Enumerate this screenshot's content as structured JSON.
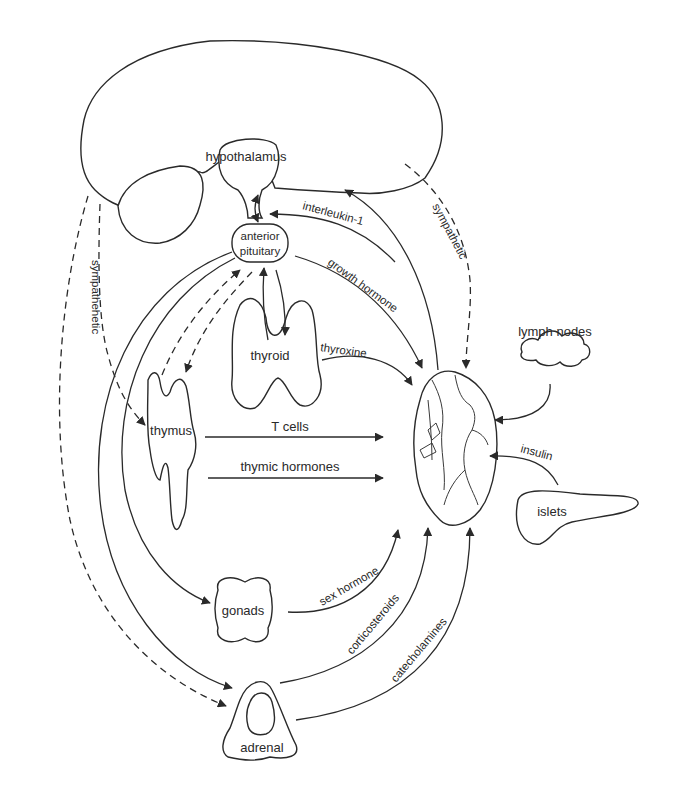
{
  "diagram": {
    "colors": {
      "stroke": "#2a2a2a",
      "background": "#ffffff"
    },
    "organs": {
      "brain": "brain",
      "hypothalamus": "hypothalamus",
      "anterior_pituitary_line1": "anterior",
      "anterior_pituitary_line2": "pituitary",
      "thyroid": "thyroid",
      "thymus": "thymus",
      "gonads": "gonads",
      "adrenal": "adrenal",
      "lymph_nodes": "lymph nodes",
      "islets": "islets",
      "spleen": "spleen"
    },
    "signals": {
      "interleukin_1": "interleukin-1",
      "growth_hormone": "growth hormone",
      "thyroxine": "thyroxine",
      "t_cells": "T cells",
      "thymic_hormones": "thymic hormones",
      "sex_hormone": "sex hormone",
      "corticosteroids": "corticosteroids",
      "catecholamines": "catecholamines",
      "insulin": "insulin",
      "sympathetic_right": "sympathetic",
      "sympathetic_left": "sympathehetic"
    },
    "edges": [
      {
        "from": "hypothalamus",
        "to": "anterior pituitary",
        "type": "bidirectional",
        "style": "solid"
      },
      {
        "from": "spleen",
        "to": "anterior pituitary",
        "label": "interleukin-1",
        "style": "solid"
      },
      {
        "from": "spleen",
        "to": "brain",
        "style": "solid"
      },
      {
        "from": "anterior pituitary",
        "to": "spleen",
        "label": "growth hormone",
        "style": "solid"
      },
      {
        "from": "brain",
        "to": "spleen",
        "label": "sympathetic",
        "style": "dashed"
      },
      {
        "from": "anterior pituitary",
        "to": "thyroid",
        "type": "bidirectional",
        "style": "solid"
      },
      {
        "from": "thyroid",
        "to": "spleen",
        "label": "thyroxine",
        "style": "solid"
      },
      {
        "from": "thymus",
        "to": "anterior pituitary",
        "type": "bidirectional",
        "style": "dashed"
      },
      {
        "from": "thymus",
        "to": "spleen",
        "label": "T cells",
        "style": "solid"
      },
      {
        "from": "thymus",
        "to": "spleen",
        "label": "thymic hormones",
        "style": "solid"
      },
      {
        "from": "brain",
        "to": "thymus",
        "label": "sympathehetic",
        "style": "dashed"
      },
      {
        "from": "brain",
        "to": "adrenal",
        "style": "dashed"
      },
      {
        "from": "anterior pituitary",
        "to": "gonads",
        "style": "solid"
      },
      {
        "from": "anterior pituitary",
        "to": "adrenal",
        "style": "solid"
      },
      {
        "from": "gonads",
        "to": "spleen",
        "label": "sex hormone",
        "style": "solid"
      },
      {
        "from": "adrenal",
        "to": "spleen",
        "label": "corticosteroids",
        "style": "solid"
      },
      {
        "from": "adrenal",
        "to": "spleen",
        "label": "catecholamines",
        "style": "solid"
      },
      {
        "from": "lymph nodes",
        "to": "spleen",
        "style": "solid"
      },
      {
        "from": "islets",
        "to": "spleen",
        "label": "insulin",
        "style": "solid"
      }
    ]
  }
}
